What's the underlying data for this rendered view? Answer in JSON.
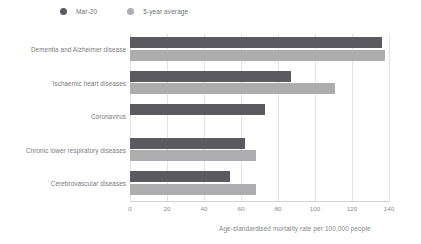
{
  "legend": {
    "items": [
      {
        "label": "Mar-20",
        "color": "#5b5a61",
        "icon": "circle-icon"
      },
      {
        "label": "5-year average",
        "color": "#adadb0",
        "icon": "circle-icon"
      }
    ]
  },
  "axis": {
    "caption": "Age-standardised mortality rate per 100,000 people",
    "ticks": [
      "0",
      "20",
      "40",
      "60",
      "80",
      "100",
      "120",
      "140"
    ]
  },
  "chart_data": {
    "type": "bar",
    "orientation": "horizontal",
    "title": "",
    "subtitle": "",
    "xlabel": "Age-standardised mortality rate per 100,000 people",
    "ylabel": "",
    "xlim": [
      0,
      140
    ],
    "xticks": [
      0,
      20,
      40,
      60,
      80,
      100,
      120,
      140
    ],
    "grid": true,
    "grid_axis": "x",
    "legend_position": "top-left",
    "categories": [
      "Dementia and Alzheimer disease",
      "Ischaemic heart diseases",
      "Coronavirus",
      "Chronic lower respiratory diseases",
      "Cerebrovascular diseases"
    ],
    "series": [
      {
        "name": "Mar-20",
        "color": "#5b5a61",
        "values": [
          136,
          87,
          73,
          62,
          54
        ]
      },
      {
        "name": "5-year average",
        "color": "#adadb0",
        "values": [
          138,
          111,
          null,
          68,
          68
        ]
      }
    ]
  }
}
